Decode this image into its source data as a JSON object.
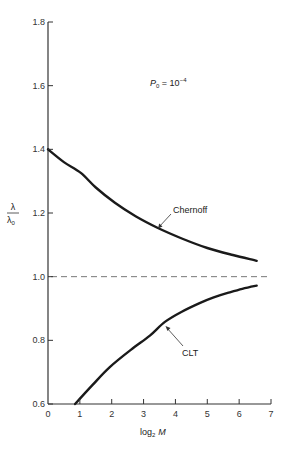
{
  "chart_data": {
    "type": "line",
    "title": "",
    "xlabel": "log2 M",
    "xlabel_parts": {
      "base": "log",
      "sub": "2",
      "var": "M"
    },
    "ylabel": "λ/λ0",
    "ylabel_parts": {
      "num": "λ",
      "den": "λ",
      "den_sub": "0"
    },
    "xlim": [
      0,
      7
    ],
    "ylim": [
      0.6,
      1.8
    ],
    "x_ticks": [
      0,
      1,
      2,
      3,
      4,
      5,
      6,
      7
    ],
    "x_tick_labels": [
      "0",
      "1",
      "2",
      "3",
      "4",
      "5",
      "6",
      "7"
    ],
    "y_ticks": [
      0.6,
      0.8,
      1.0,
      1.2,
      1.4,
      1.6,
      1.8
    ],
    "y_tick_labels": [
      "0.6",
      "0.8",
      "1.0",
      "1.2",
      "1.4",
      "1.6",
      "1.8"
    ],
    "grid": false,
    "legend": null,
    "annotations": [
      {
        "text": "P0 = 10^-4",
        "parts": {
          "var": "P",
          "sub": "0",
          "eq": " = 10",
          "sup": "−4"
        }
      },
      {
        "text": "Chernoff",
        "points_to": "Chernoff"
      },
      {
        "text": "CLT",
        "points_to": "CLT"
      }
    ],
    "reference_line": {
      "y": 1.0,
      "style": "dashed"
    },
    "series": [
      {
        "name": "Chernoff",
        "x": [
          0,
          0.5,
          1.03,
          1.5,
          2.1,
          2.75,
          3.45,
          4.2,
          5.0,
          5.8,
          6.55
        ],
        "y": [
          1.4,
          1.36,
          1.326,
          1.28,
          1.232,
          1.19,
          1.153,
          1.12,
          1.09,
          1.068,
          1.05
        ]
      },
      {
        "name": "CLT",
        "x": [
          0.85,
          1.4,
          1.94,
          2.6,
          3.2,
          3.67,
          4.2,
          4.76,
          5.2,
          5.64,
          6.1,
          6.55
        ],
        "y": [
          0.6,
          0.66,
          0.716,
          0.77,
          0.815,
          0.858,
          0.89,
          0.917,
          0.935,
          0.949,
          0.962,
          0.972
        ]
      }
    ]
  }
}
